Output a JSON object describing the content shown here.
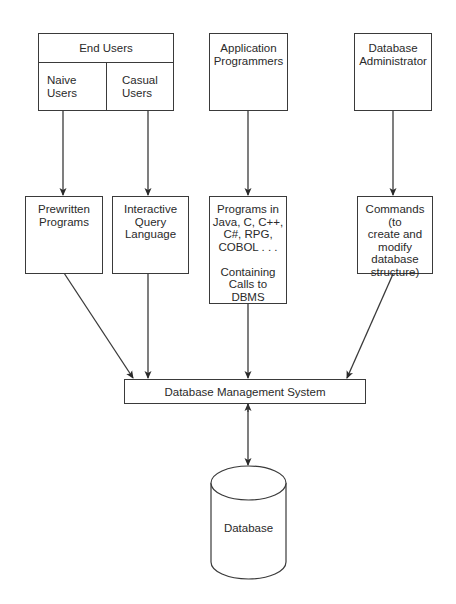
{
  "diagram": {
    "type": "flowchart",
    "top_row": {
      "end_users": {
        "title": "End Users",
        "sub": [
          {
            "label": "Naive\nUsers"
          },
          {
            "label": "Casual\nUsers"
          }
        ]
      },
      "app_programmers": {
        "label": "Application\nProgrammers"
      },
      "dba": {
        "label": "Database\nAdministrator"
      }
    },
    "middle_row": {
      "prewritten": {
        "label": "Prewritten\nPrograms"
      },
      "iql": {
        "label": "Interactive\nQuery\nLanguage"
      },
      "programs": {
        "label": "Programs in\nJava, C, C++,\nC#, RPG,\nCOBOL . . .\n\nContaining\nCalls to\nDBMS"
      },
      "commands": {
        "label": "Commands (to\ncreate and\nmodify\ndatabase\nstructure)"
      }
    },
    "dbms": {
      "label": "Database Management System"
    },
    "database": {
      "label": "Database"
    },
    "edges": [
      {
        "from": "Naive Users",
        "to": "Prewritten Programs"
      },
      {
        "from": "Casual Users",
        "to": "Interactive Query Language"
      },
      {
        "from": "Application Programmers",
        "to": "Programs in Java, C, C++, C#, RPG, COBOL... Containing Calls to DBMS"
      },
      {
        "from": "Database Administrator",
        "to": "Commands (to create and modify database structure)"
      },
      {
        "from": "Prewritten Programs",
        "to": "Database Management System"
      },
      {
        "from": "Interactive Query Language",
        "to": "Database Management System"
      },
      {
        "from": "Programs",
        "to": "Database Management System"
      },
      {
        "from": "Commands",
        "to": "Database Management System"
      },
      {
        "from": "Database Management System",
        "to": "Database",
        "bidirectional": true
      }
    ],
    "colors": {
      "line": "#3a3a3a",
      "background": "#ffffff",
      "text": "#2a2a2a"
    }
  }
}
